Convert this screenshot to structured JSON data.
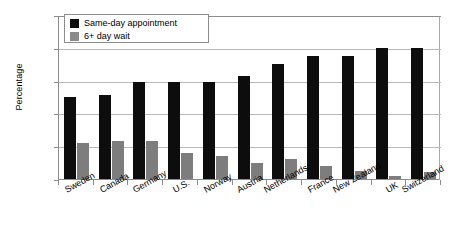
{
  "chart_data": {
    "type": "bar",
    "title": "",
    "xlabel": "",
    "ylabel": "Percentage",
    "ylim": [
      0,
      100
    ],
    "yticks": [
      "0%",
      "20%",
      "40%",
      "60%",
      "80%",
      "100%"
    ],
    "ytick_values": [
      0,
      20,
      40,
      60,
      80,
      100
    ],
    "grid": true,
    "legend_position": "top-left",
    "categories": [
      "Sweden",
      "Canada",
      "Germany",
      "U.S.",
      "Norway",
      "Austria",
      "Netherlands",
      "France",
      "New Zealand",
      "UK",
      "Switzerland"
    ],
    "series": [
      {
        "name": "Same-day appointment",
        "color": "#0d0d0d",
        "values": [
          50,
          51,
          59,
          59,
          59,
          63,
          70,
          75,
          75,
          80,
          80
        ]
      },
      {
        "name": "6+ day wait",
        "color": "#7d7d7d",
        "values": [
          22,
          23,
          23,
          16,
          14,
          10,
          12.5,
          8,
          5,
          2,
          4
        ]
      }
    ]
  },
  "legend": {
    "items": [
      {
        "label": "Same-day appointment",
        "swatch": "series-a"
      },
      {
        "label": "6+ day wait",
        "swatch": "series-b"
      }
    ]
  }
}
